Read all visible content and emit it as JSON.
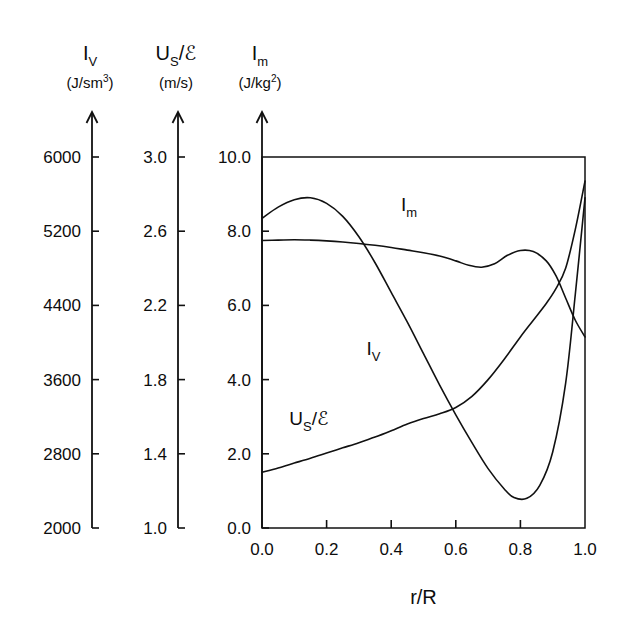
{
  "figure": {
    "xlabel": "r/R",
    "axes": [
      {
        "id": "iv",
        "symbol": "I",
        "symbol_sub": "V",
        "units": "(J/sm",
        "units_sup": "3",
        "units_close": ")",
        "ticks": [
          "6000",
          "5200",
          "4400",
          "3600",
          "2800",
          "2000"
        ],
        "min": 2000,
        "max": 6000,
        "step": 800
      },
      {
        "id": "us",
        "symbol": "U",
        "symbol_sub": "S",
        "symbol_tail": "/ℰ",
        "units": "(m/s)",
        "units_sup": "",
        "units_close": "",
        "ticks": [
          "3.0",
          "2.6",
          "2.2",
          "1.8",
          "1.4",
          "1.0"
        ],
        "min": 1.0,
        "max": 3.0,
        "step": 0.4
      },
      {
        "id": "im",
        "symbol": "I",
        "symbol_sub": "m",
        "units": "(J/kg",
        "units_sup": "2",
        "units_close": ")",
        "ticks": [
          "10.0",
          "8.0",
          "6.0",
          "4.0",
          "2.0",
          "0.0"
        ],
        "min": 0.0,
        "max": 10.0,
        "step": 2.0
      }
    ],
    "xticks": [
      "0.0",
      "0.2",
      "0.4",
      "0.6",
      "0.8",
      "1.0"
    ],
    "curve_labels": [
      {
        "id": "im",
        "symbol": "I",
        "sub": "m",
        "tail": "",
        "x": 0.455,
        "y": 8.55
      },
      {
        "id": "iv",
        "symbol": "I",
        "sub": "V",
        "tail": "",
        "x": 0.345,
        "y": 4.65
      },
      {
        "id": "us",
        "symbol": "U",
        "sub": "S",
        "tail": "/ℰ",
        "x": 0.145,
        "y": 2.78
      }
    ]
  },
  "chart_data": {
    "type": "line",
    "title": "",
    "xlabel": "r/R",
    "ylabel": "",
    "xlim": [
      0.0,
      1.0
    ],
    "ylim": [
      0.0,
      10.0
    ],
    "grid": false,
    "legend": "inline-labels",
    "note": "Triple parallel y-axes: I_V (J/sm^3) 2000-6000, U_S/epsilon (m/s) 1.0-3.0, I_m (J/kg^2) 0.0-10.0. All three curves are plotted against the right-hand 0-10 scale; values below are in those right-axis units.",
    "series": [
      {
        "name": "I_V",
        "axis": "left",
        "axis_units": "J/sm^3",
        "axis_range": [
          2000,
          6000
        ],
        "x": [
          0.0,
          0.05,
          0.1,
          0.15,
          0.2,
          0.25,
          0.3,
          0.35,
          0.4,
          0.45,
          0.5,
          0.55,
          0.6,
          0.65,
          0.7,
          0.75,
          0.78,
          0.82,
          0.86,
          0.9,
          0.94,
          0.97,
          1.0
        ],
        "values": [
          8.35,
          8.65,
          8.85,
          8.9,
          8.75,
          8.4,
          7.85,
          7.15,
          6.35,
          5.55,
          4.7,
          3.85,
          3.05,
          2.3,
          1.6,
          1.05,
          0.82,
          0.8,
          1.15,
          2.05,
          3.9,
          6.3,
          8.9
        ]
      },
      {
        "name": "I_m",
        "axis": "right",
        "axis_units": "J/kg^2",
        "axis_range": [
          0.0,
          10.0
        ],
        "x": [
          0.0,
          0.05,
          0.1,
          0.15,
          0.2,
          0.25,
          0.3,
          0.35,
          0.4,
          0.45,
          0.5,
          0.55,
          0.6,
          0.64,
          0.68,
          0.72,
          0.76,
          0.8,
          0.84,
          0.88,
          0.91,
          0.94,
          0.97,
          1.0
        ],
        "values": [
          7.75,
          7.76,
          7.77,
          7.76,
          7.74,
          7.71,
          7.67,
          7.62,
          7.56,
          7.49,
          7.42,
          7.33,
          7.2,
          7.08,
          7.03,
          7.12,
          7.35,
          7.48,
          7.45,
          7.2,
          6.8,
          6.2,
          5.6,
          5.15
        ]
      },
      {
        "name": "U_S/epsilon",
        "axis": "middle",
        "axis_units": "m/s",
        "axis_range": [
          1.0,
          3.0
        ],
        "x": [
          0.0,
          0.05,
          0.1,
          0.15,
          0.2,
          0.25,
          0.3,
          0.35,
          0.4,
          0.45,
          0.5,
          0.55,
          0.6,
          0.65,
          0.7,
          0.75,
          0.8,
          0.84,
          0.88,
          0.91,
          0.94,
          0.97,
          1.0
        ],
        "values": [
          1.5,
          1.62,
          1.75,
          1.88,
          2.02,
          2.16,
          2.3,
          2.45,
          2.62,
          2.8,
          2.95,
          3.08,
          3.25,
          3.55,
          4.0,
          4.55,
          5.15,
          5.6,
          6.05,
          6.45,
          7.0,
          8.05,
          9.35
        ]
      }
    ]
  }
}
